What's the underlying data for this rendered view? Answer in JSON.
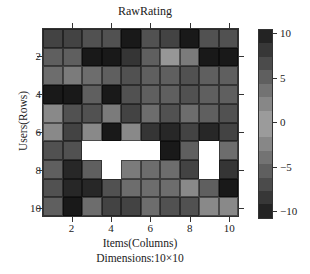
{
  "chart_data": {
    "type": "heatmap",
    "title": "RawRating",
    "xlabel": "Items(Columns)",
    "ylabel": "Users(Rows)",
    "subtitle": "Dimensions:10×10",
    "x_ticks": [
      "2",
      "4",
      "6",
      "8",
      "10"
    ],
    "y_ticks": [
      "2",
      "4",
      "6",
      "8",
      "10"
    ],
    "colorbar": {
      "range": [
        -10,
        10
      ],
      "ticks": [
        "10",
        "5",
        "0",
        "−10",
        "−5"
      ],
      "tick_values": [
        10,
        5,
        0,
        -5,
        -10
      ],
      "colormap": "grey diverging: dark at both extremes, light near 0"
    },
    "rows": 10,
    "cols": 10,
    "missing_cells": [
      [
        7,
        3
      ],
      [
        7,
        4
      ],
      [
        7,
        5
      ],
      [
        7,
        6
      ],
      [
        8,
        4
      ],
      [
        7,
        9
      ],
      [
        8,
        9
      ]
    ],
    "values": [
      [
        7,
        7,
        6,
        6,
        10,
        6,
        7,
        10,
        6,
        6
      ],
      [
        5,
        5,
        10,
        10,
        8,
        5,
        1,
        3,
        10,
        10
      ],
      [
        4,
        3,
        4,
        5,
        6,
        5,
        5,
        6,
        5,
        5
      ],
      [
        10,
        10,
        5,
        10,
        6,
        5,
        5,
        6,
        5,
        5
      ],
      [
        2,
        6,
        6,
        3,
        7,
        4,
        6,
        4,
        5,
        6
      ],
      [
        2,
        7,
        2,
        10,
        2,
        8,
        9,
        7,
        9,
        7
      ],
      [
        6,
        6,
        null,
        null,
        null,
        null,
        10,
        5,
        null,
        4
      ],
      [
        5,
        9,
        5,
        null,
        3,
        4,
        4,
        7,
        null,
        8
      ],
      [
        6,
        9,
        9,
        6,
        4,
        4,
        4,
        2,
        5,
        10
      ],
      [
        5,
        10,
        4,
        7,
        7,
        4,
        6,
        6,
        2,
        2
      ]
    ]
  }
}
